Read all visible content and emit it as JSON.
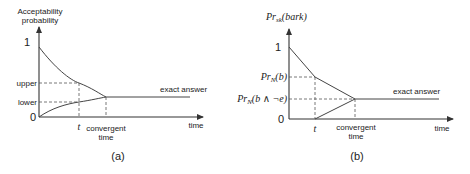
{
  "panel_a": {
    "caption": "(a)",
    "y_axis_label_line1": "Acceptability",
    "y_axis_label_line2": "probability",
    "y_tick_one": "1",
    "y_tick_upper": "upper",
    "y_tick_lower": "lower",
    "y_tick_zero": "0",
    "x_tick_t": "t",
    "x_tick_convergent_line1": "convergent",
    "x_tick_convergent_line2": "time",
    "x_axis_label": "time",
    "line_label": "exact answer"
  },
  "panel_b": {
    "caption": "(b)",
    "y_axis_label_main": "Pr",
    "y_axis_label_sub": "sk",
    "y_axis_label_arg": "(bark)",
    "y_tick_one": "1",
    "y_tick_prn_b_main": "Pr",
    "y_tick_prn_b_sub": "N",
    "y_tick_prn_b_arg": "(b)",
    "y_tick_prn_be_main": "Pr",
    "y_tick_prn_be_sub": "N",
    "y_tick_prn_be_arg": "(b ∧ ¬e)",
    "y_tick_zero": "0",
    "x_tick_t": "t",
    "x_tick_convergent_line1": "convergent",
    "x_tick_convergent_line2": "time",
    "x_axis_label": "time",
    "line_label": "exact answer"
  }
}
